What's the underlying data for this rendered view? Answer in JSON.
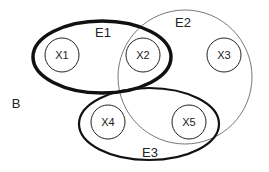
{
  "diagram": {
    "type": "hypergraph-venn",
    "background_label": "B",
    "hyperedges": [
      {
        "id": "E1",
        "label": "E1",
        "shape": "ellipse",
        "members": [
          "X1",
          "X2"
        ],
        "stroke": "#111111",
        "stroke_weight": "thick"
      },
      {
        "id": "E2",
        "label": "E2",
        "shape": "circle",
        "members": [
          "X2",
          "X3",
          "X5"
        ],
        "stroke": "#555555",
        "stroke_weight": "thin"
      },
      {
        "id": "E3",
        "label": "E3",
        "shape": "ellipse",
        "members": [
          "X4",
          "X5"
        ],
        "stroke": "#111111",
        "stroke_weight": "medium"
      }
    ],
    "nodes": [
      {
        "id": "X1",
        "label": "X1"
      },
      {
        "id": "X2",
        "label": "X2"
      },
      {
        "id": "X3",
        "label": "X3"
      },
      {
        "id": "X4",
        "label": "X4"
      },
      {
        "id": "X5",
        "label": "X5"
      }
    ]
  }
}
